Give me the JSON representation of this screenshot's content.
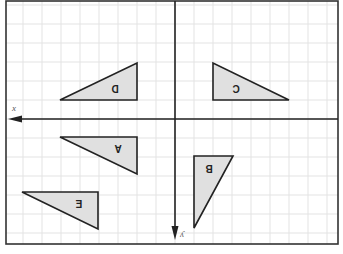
{
  "diagram": {
    "type": "coordinate-grid-reflection",
    "frame": {
      "x": 6,
      "y": 1,
      "width": 332,
      "height": 243,
      "stroke": "#333333"
    },
    "grid": {
      "spacing": 19,
      "color": "#e3e3e3",
      "origin_x": 175,
      "origin_y": 119
    },
    "axes": {
      "x": {
        "label": "x",
        "y": 119,
        "from": 338,
        "to": 8,
        "direction": "left"
      },
      "y": {
        "label": "y",
        "x": 175,
        "from": 1,
        "to": 240,
        "direction": "down"
      }
    },
    "fill_color": "#e0e0e0",
    "stroke_color": "#222222",
    "triangles": [
      {
        "label": "D",
        "points": "60,100 137,100 137,63",
        "label_x": 115,
        "label_y": 88,
        "rotate": 180
      },
      {
        "label": "C",
        "points": "213,63 213,100 289,100",
        "label_x": 236,
        "label_y": 88,
        "rotate": 180
      },
      {
        "label": "A",
        "points": "60,137 137,137 137,174",
        "label_x": 118,
        "label_y": 148,
        "rotate": 180
      },
      {
        "label": "B",
        "points": "194,156 233,156 194,228",
        "label_x": 209,
        "label_y": 168,
        "rotate": 180
      },
      {
        "label": "E",
        "points": "22,192 98,192 98,229",
        "label_x": 79,
        "label_y": 203,
        "rotate": 180
      }
    ]
  }
}
